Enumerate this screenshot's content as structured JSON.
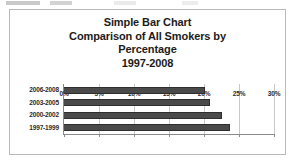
{
  "chart_data": {
    "type": "bar",
    "orientation": "horizontal",
    "title": "Simple Bar Chart Comparison of All Smokers by Percentage 1997-2008",
    "title_lines": [
      "Simple Bar Chart",
      "Comparison of All Smokers by",
      "Percentage",
      "1997-2008"
    ],
    "categories": [
      "2006-2008",
      "2003-2005",
      "2000-2002",
      "1997-1999"
    ],
    "values": [
      20.2,
      20.9,
      22.6,
      23.7
    ],
    "xlabel": "",
    "ylabel": "",
    "xlim": [
      0,
      30
    ],
    "xtick_labels": [
      "0%",
      "5%",
      "10%",
      "15%",
      "20%",
      "25%",
      "30%"
    ],
    "xtick_values": [
      0,
      5,
      10,
      15,
      20,
      25,
      30
    ],
    "grid": true,
    "grid_axis": "x",
    "legend": false,
    "bar_color": "#4a4a4a",
    "bar_edge_color": "#2e2e2e",
    "gridline_color": "#c8c8c8",
    "axis_color": "#8a8a8a",
    "frame_color": "#b9b9b9",
    "text_color": "#1b1b1b"
  }
}
